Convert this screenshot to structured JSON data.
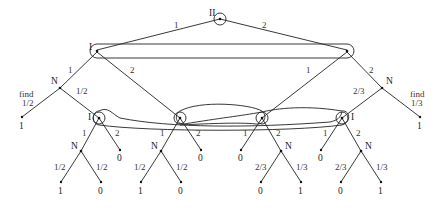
{
  "diagram": {
    "type": "extensive-form game tree",
    "root": {
      "player": "II",
      "actions": [
        "1",
        "2"
      ]
    },
    "top_info_set": {
      "player": "I",
      "left_node": {
        "actions": [
          "1",
          "2"
        ]
      },
      "right_node": {
        "actions": [
          "1",
          "2"
        ]
      }
    },
    "chance_left": {
      "player": "N",
      "find_label": "find",
      "find_prob": "1/2",
      "other_prob": "1/2",
      "find_payoff": "1"
    },
    "chance_right": {
      "player": "N",
      "find_label": "find",
      "find_prob": "1/3",
      "other_prob": "2/3",
      "find_payoff": "1"
    },
    "bottom_info_set": {
      "player": "I",
      "nodes": [
        {
          "player": "I",
          "action1": "1",
          "action2": "2",
          "chance": {
            "player": "N",
            "probs": [
              "1/2",
              "1/2"
            ],
            "payoffs": [
              "1",
              "0"
            ]
          },
          "action2_payoff": "0"
        },
        {
          "player": "",
          "action1": "1",
          "action2": "2",
          "chance": {
            "player": "N",
            "probs": [
              "1/2",
              "1/2"
            ],
            "payoffs": [
              "1",
              "0"
            ]
          },
          "action2_payoff": "0"
        },
        {
          "player": "",
          "action1": "1",
          "action2": "2",
          "action1_payoff": "0",
          "chance": {
            "player": "N",
            "probs": [
              "2/3",
              "1/3"
            ],
            "payoffs": [
              "0",
              "1"
            ]
          }
        },
        {
          "player": "I",
          "action1": "1",
          "action2": "2",
          "action1_payoff": "0",
          "chance": {
            "player": "N",
            "probs": [
              "2/3",
              "1/3"
            ],
            "payoffs": [
              "0",
              "1"
            ]
          }
        }
      ]
    }
  }
}
